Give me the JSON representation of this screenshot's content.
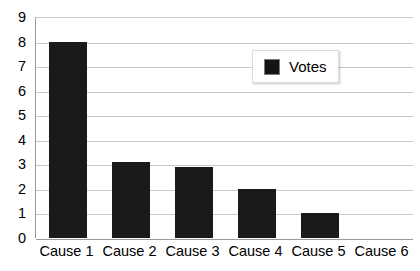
{
  "chart_data": {
    "type": "bar",
    "title": "",
    "subtitle": "",
    "xlabel": "",
    "ylabel": "",
    "categories": [
      "Cause 1",
      "Cause 2",
      "Cause 3",
      "Cause 4",
      "Cause 5",
      "Cause 6"
    ],
    "series": [
      {
        "name": "Votes",
        "values": [
          8,
          3.1,
          2.9,
          2,
          1,
          0
        ],
        "color": "#1a1a1a"
      }
    ],
    "ylim": [
      0,
      9
    ],
    "ytick_labels": [
      "9",
      "8",
      "7",
      "6",
      "5",
      "4",
      "3",
      "2",
      "1",
      "0"
    ],
    "ytick_values": [
      9,
      8,
      7,
      6,
      5,
      4,
      3,
      2,
      1,
      0
    ],
    "grid": {
      "horizontal": true,
      "vertical": false,
      "color": "#c9c9c9"
    },
    "legend": {
      "position": "inside-top-right",
      "entries": [
        {
          "label": "Votes",
          "color": "#1a1a1a"
        }
      ]
    },
    "axis_color": "#9a9a9a",
    "background": "#ffffff"
  }
}
